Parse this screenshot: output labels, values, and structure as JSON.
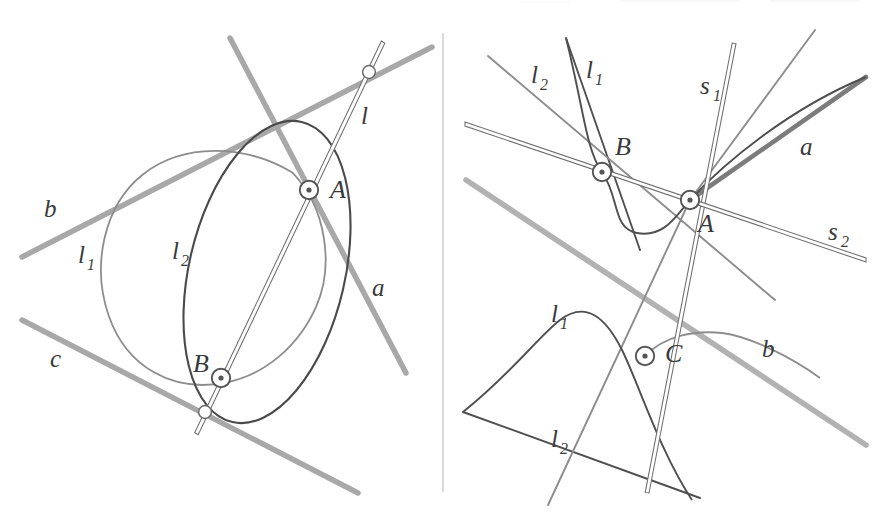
{
  "figure": {
    "kind": "geometry-diagram",
    "background_color": "#ffffff",
    "divider_color": "#d2d2d2",
    "colors": {
      "thick_gray_line": "#a8a8a8",
      "thin_dark_curve": "#4a4a4a",
      "mid_gray_curve": "#7d7d7d",
      "rail_line_stroke": "#6e6e6e",
      "rail_line_fill": "#ffffff",
      "label_text": "#333333",
      "point_marker_ring": "#555555",
      "point_marker_fill": "#ffffff"
    },
    "panels": [
      {
        "id": "left",
        "name": "left-panel",
        "labels": [
          {
            "id": "b",
            "text": "b",
            "sub": "",
            "x": 44,
            "y": 217
          },
          {
            "id": "c",
            "text": "c",
            "sub": "",
            "x": 50,
            "y": 367
          },
          {
            "id": "l",
            "text": "l",
            "sub": "",
            "x": 361,
            "y": 124
          },
          {
            "id": "a",
            "text": "a",
            "sub": "",
            "x": 372,
            "y": 296
          },
          {
            "id": "l1",
            "text": "l",
            "sub": "1",
            "x": 78,
            "y": 263
          },
          {
            "id": "l2",
            "text": "l",
            "sub": "2",
            "x": 172,
            "y": 259
          },
          {
            "id": "A",
            "text": "A",
            "sub": "",
            "x": 330,
            "y": 198
          },
          {
            "id": "B",
            "text": "B",
            "sub": "",
            "x": 193,
            "y": 372
          }
        ],
        "points": [
          {
            "id": "A",
            "x": 309,
            "y": 190,
            "type": "dotted-ring"
          },
          {
            "id": "B",
            "x": 221,
            "y": 378,
            "type": "dotted-ring"
          },
          {
            "id": "l-meets-b",
            "x": 369,
            "y": 72,
            "type": "open-ring"
          },
          {
            "id": "l-meets-c",
            "x": 205,
            "y": 412,
            "type": "open-ring"
          }
        ],
        "line_count": 3,
        "conic_count": 2
      },
      {
        "id": "right",
        "name": "right-panel",
        "labels": [
          {
            "id": "l2-top",
            "text": "l",
            "sub": "2",
            "x": 531,
            "y": 83
          },
          {
            "id": "l1-top",
            "text": "l",
            "sub": "1",
            "x": 586,
            "y": 78
          },
          {
            "id": "s1",
            "text": "s",
            "sub": "1",
            "x": 700,
            "y": 94
          },
          {
            "id": "a",
            "text": "a",
            "sub": "",
            "x": 800,
            "y": 155
          },
          {
            "id": "s2",
            "text": "s",
            "sub": "2",
            "x": 828,
            "y": 240
          },
          {
            "id": "b",
            "text": "b",
            "sub": "",
            "x": 762,
            "y": 357
          },
          {
            "id": "l1-bot",
            "text": "l",
            "sub": "1",
            "x": 551,
            "y": 322
          },
          {
            "id": "l2-bot",
            "text": "l",
            "sub": "2",
            "x": 551,
            "y": 447
          },
          {
            "id": "A",
            "text": "A",
            "sub": "",
            "x": 698,
            "y": 232
          },
          {
            "id": "B",
            "text": "B",
            "sub": "",
            "x": 615,
            "y": 155
          },
          {
            "id": "C",
            "text": "C",
            "sub": "",
            "x": 665,
            "y": 362
          }
        ],
        "points": [
          {
            "id": "A",
            "x": 690,
            "y": 200,
            "type": "dotted-ring"
          },
          {
            "id": "B",
            "x": 602,
            "y": 172,
            "type": "dotted-ring"
          },
          {
            "id": "C",
            "x": 645,
            "y": 356,
            "type": "dotted-ring"
          }
        ],
        "line_count": 6,
        "conic_count": 2
      }
    ]
  }
}
